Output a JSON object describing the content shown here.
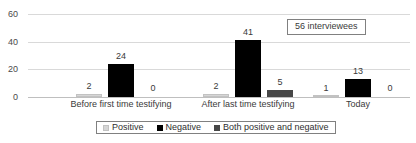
{
  "chart_data": {
    "type": "bar",
    "title": "",
    "xlabel": "",
    "ylabel": "",
    "categories": [
      "Before first time testifying",
      "After last time testifying",
      "Today"
    ],
    "series": [
      {
        "name": "Positive",
        "color": "#d6d6d6",
        "values": [
          2,
          2,
          1
        ]
      },
      {
        "name": "Negative",
        "color": "#000000",
        "values": [
          24,
          41,
          13
        ]
      },
      {
        "name": "Both positive and negative",
        "color": "#474747",
        "values": [
          0,
          5,
          0
        ]
      }
    ],
    "ylim": [
      0,
      60
    ],
    "yticks": [
      0,
      20,
      40,
      60
    ],
    "ytick_labels": [
      "0",
      "20",
      "40",
      "60"
    ],
    "grid": true,
    "legend_position": "bottom",
    "annotations": [
      {
        "text": "56 interviewees"
      }
    ]
  },
  "yaxis": {
    "ticks": [
      {
        "label": "60",
        "value": 60
      },
      {
        "label": "40",
        "value": 40
      },
      {
        "label": "20",
        "value": 20
      },
      {
        "label": "0",
        "value": 0
      }
    ]
  },
  "groups": [
    {
      "label": "Before first time testifying",
      "bars": [
        {
          "series": "Positive",
          "value": 2,
          "label": "2"
        },
        {
          "series": "Negative",
          "value": 24,
          "label": "24"
        },
        {
          "series": "Both positive and negative",
          "value": 0,
          "label": "0"
        }
      ]
    },
    {
      "label": "After last time testifying",
      "bars": [
        {
          "series": "Positive",
          "value": 2,
          "label": "2"
        },
        {
          "series": "Negative",
          "value": 41,
          "label": "41"
        },
        {
          "series": "Both positive and negative",
          "value": 5,
          "label": "5"
        }
      ]
    },
    {
      "label": "Today",
      "bars": [
        {
          "series": "Positive",
          "value": 1,
          "label": "1"
        },
        {
          "series": "Negative",
          "value": 13,
          "label": "13"
        },
        {
          "series": "Both positive and negative",
          "value": 0,
          "label": "0"
        }
      ]
    }
  ],
  "annotation": {
    "text": "56 interviewees"
  },
  "legend": {
    "items": [
      {
        "label": "Positive",
        "swatch": "series-positive"
      },
      {
        "label": "Negative",
        "swatch": "series-negative"
      },
      {
        "label": "Both positive and negative",
        "swatch": "series-both"
      }
    ]
  }
}
